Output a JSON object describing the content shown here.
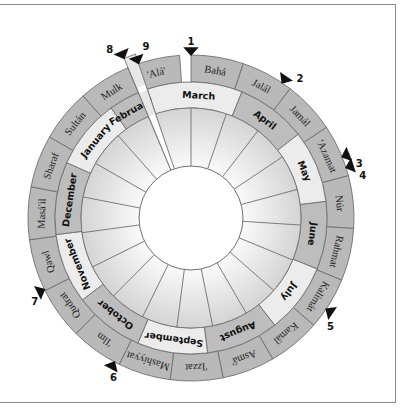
{
  "diagram": {
    "center": [
      191,
      218
    ],
    "radii": {
      "outer": 163,
      "bahai_inner": 136,
      "gregorian_inner": 110,
      "hole": 52
    },
    "colors": {
      "bahai_ring": "#b9b9b9",
      "gregorian_light": "#ececec",
      "gregorian_dark": "#bdbdbd",
      "inner_fill": "#dedede",
      "intercalary": "#e8e8e8",
      "stroke": "#6f6f6f",
      "hole": "#ffffff",
      "frame": "#8a8a8a"
    },
    "intercalary_wedge": {
      "name": "Ayyám-i-Há",
      "start_deg": -22.74,
      "end_deg": -18.74
    },
    "bahai_months": [
      "Bahá",
      "Jalál",
      "Jamál",
      "'Azamat",
      "Núr",
      "Rahmat",
      "Kalimát",
      "Kamál",
      "Asmá'",
      "'Izzat",
      "Mashíyyat",
      "'Ilm",
      "Qudrat",
      "Qawl",
      "Masá'il",
      "Sharaf",
      "Sultán",
      "Mulk",
      "'Alá'"
    ],
    "gregorian_months": [
      {
        "name": "March",
        "shade": "light",
        "start_deg": -18.74,
        "end_deg": 22
      },
      {
        "name": "April",
        "shade": "dark",
        "start_deg": 22,
        "end_deg": 52
      },
      {
        "name": "May",
        "shade": "light",
        "start_deg": 52,
        "end_deg": 83
      },
      {
        "name": "June",
        "shade": "dark",
        "start_deg": 83,
        "end_deg": 112
      },
      {
        "name": "July",
        "shade": "light",
        "start_deg": 112,
        "end_deg": 142
      },
      {
        "name": "August",
        "shade": "dark",
        "start_deg": 142,
        "end_deg": 173
      },
      {
        "name": "September",
        "shade": "light",
        "start_deg": 173,
        "end_deg": 203
      },
      {
        "name": "October",
        "shade": "dark",
        "start_deg": 203,
        "end_deg": 233
      },
      {
        "name": "November",
        "shade": "light",
        "start_deg": 233,
        "end_deg": 263
      },
      {
        "name": "December",
        "shade": "dark",
        "start_deg": 263,
        "end_deg": 294
      },
      {
        "name": "January",
        "shade": "light",
        "start_deg": 294,
        "end_deg": 324
      },
      {
        "name": "February",
        "shade": "dark",
        "start_deg": 324,
        "end_deg": 337.26
      }
    ],
    "markers": [
      {
        "label": "1",
        "deg": 0
      },
      {
        "label": "2",
        "deg": 34
      },
      {
        "label": "3",
        "deg": 68
      },
      {
        "label": "4",
        "deg": 72
      },
      {
        "label": "5",
        "deg": 124
      },
      {
        "label": "6",
        "deg": 208
      },
      {
        "label": "7",
        "deg": 244
      },
      {
        "label": "8",
        "deg": -22.74
      },
      {
        "label": "9",
        "deg": -18.74
      }
    ]
  }
}
